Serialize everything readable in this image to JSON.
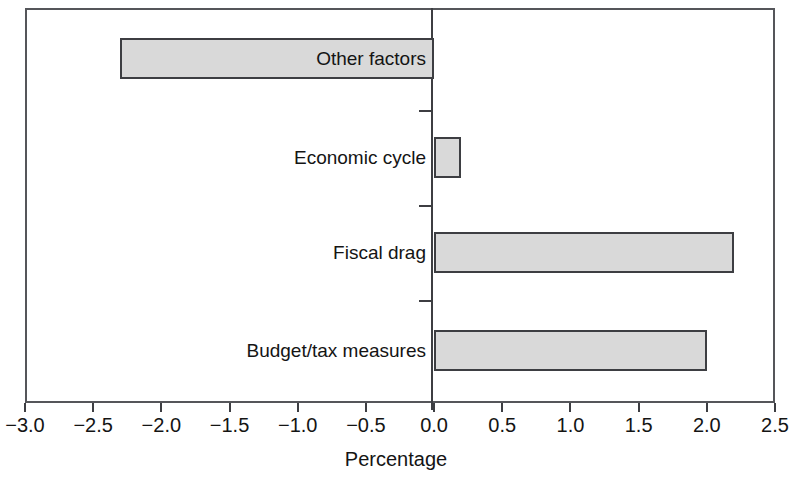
{
  "chart_data": {
    "type": "bar",
    "orientation": "horizontal",
    "title": "",
    "xlabel": "Percentage",
    "ylabel": "",
    "categories": [
      "Other factors",
      "Economic cycle",
      "Fiscal drag",
      "Budget/tax measures"
    ],
    "values": [
      -2.3,
      0.2,
      2.2,
      2.0
    ],
    "series": [
      {
        "name": "Percentage",
        "values": [
          -2.3,
          0.2,
          2.2,
          2.0
        ]
      }
    ],
    "xlim": [
      -3.0,
      2.5
    ],
    "xticks": [
      -3.0,
      -2.5,
      -2.0,
      -1.5,
      -1.0,
      -0.5,
      0.0,
      0.5,
      1.0,
      1.5,
      2.0,
      2.5
    ],
    "xtick_labels": [
      "-3.0",
      "-2.5",
      "-2.0",
      "-1.5",
      "-1.0",
      "-0.5",
      "0.0",
      "0.5",
      "1.0",
      "1.5",
      "2.0",
      "2.5"
    ],
    "grid": false,
    "legend": false,
    "zero_line": 0.0,
    "bar_fill_color": "#d9d9d9",
    "bar_edge_color": "#3d3e42",
    "frame_color": "#55565a",
    "background_color": "#ffffff",
    "label_placement": [
      "inside-bar",
      "outside-left",
      "outside-left",
      "outside-left"
    ]
  },
  "axis": {
    "title": "Percentage"
  },
  "bars": [
    {
      "label": "Other factors",
      "value": -2.3
    },
    {
      "label": "Economic cycle",
      "value": 0.2
    },
    {
      "label": "Fiscal drag",
      "value": 2.2
    },
    {
      "label": "Budget/tax measures",
      "value": 2.0
    }
  ],
  "xticks": [
    {
      "label": "-3.0"
    },
    {
      "label": "-2.5"
    },
    {
      "label": "-2.0"
    },
    {
      "label": "-1.5"
    },
    {
      "label": "-1.0"
    },
    {
      "label": "-0.5"
    },
    {
      "label": "0.0"
    },
    {
      "label": "0.5"
    },
    {
      "label": "1.0"
    },
    {
      "label": "1.5"
    },
    {
      "label": "2.0"
    },
    {
      "label": "2.5"
    }
  ]
}
